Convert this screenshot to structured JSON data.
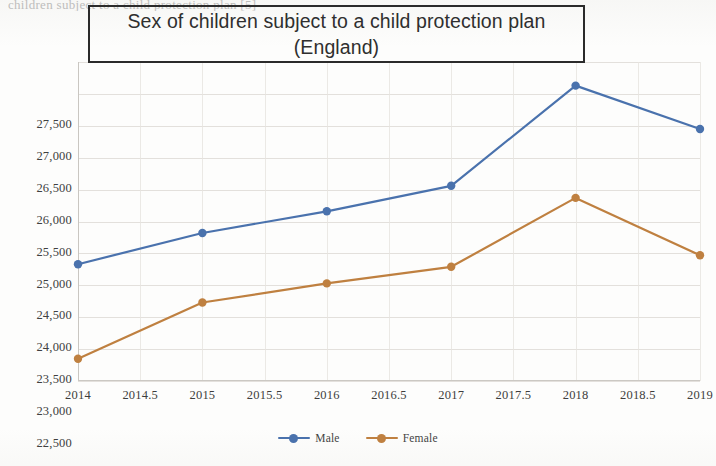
{
  "top_cut_text": "children subject to a child protection plan [5]",
  "title": {
    "line1": "Sex of children subject to a child protection plan",
    "line2": "(England)"
  },
  "colors": {
    "male": "#4a72ad",
    "female": "#bf8040",
    "grid": "#dedbd6",
    "axis": "#c9c6c1",
    "title_border": "#2b2b2b",
    "text": "#3d3d3d"
  },
  "legend": {
    "position": "bottom-center",
    "items": [
      {
        "label": "Male",
        "color": "#4a72ad"
      },
      {
        "label": "Female",
        "color": "#bf8040"
      }
    ]
  },
  "chart_data": {
    "type": "line",
    "title": "Sex of children subject to a child protection plan (England)",
    "xlabel": "",
    "ylabel": "",
    "grid": true,
    "x": [
      2014,
      2015,
      2016,
      2017,
      2018,
      2019
    ],
    "xlim": [
      2014,
      2019
    ],
    "ylim": [
      22500,
      27500
    ],
    "ytick_labels": [
      "27,500",
      "27,000",
      "26,500",
      "26,000",
      "25,500",
      "25,000",
      "24,500",
      "24,000",
      "23,500",
      "23,000",
      "22,500"
    ],
    "ytick_values": [
      27500,
      27000,
      26500,
      26000,
      25500,
      25000,
      24500,
      24000,
      23500,
      23000,
      22500
    ],
    "xtick_labels": [
      "2014",
      "2014.5",
      "2015",
      "2015.5",
      "2016",
      "2016.5",
      "2017",
      "2017.5",
      "2018",
      "2018.5",
      "2019"
    ],
    "xtick_values": [
      2014,
      2014.5,
      2015,
      2015.5,
      2016,
      2016.5,
      2017,
      2017.5,
      2018,
      2018.5,
      2019
    ],
    "series": [
      {
        "name": "Male",
        "color": "#4a72ad",
        "values": [
          24330,
          24820,
          25160,
          25560,
          27130,
          26450
        ]
      },
      {
        "name": "Female",
        "color": "#bf8040",
        "values": [
          22850,
          23730,
          24030,
          24290,
          25370,
          24470
        ]
      }
    ]
  }
}
